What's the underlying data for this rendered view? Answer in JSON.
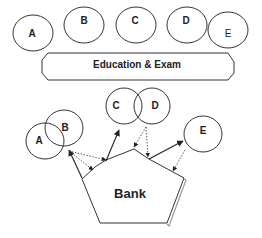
{
  "top_circles": [
    {
      "label": "A"
    },
    {
      "label": "B"
    },
    {
      "label": "C"
    },
    {
      "label": "D"
    },
    {
      "label": "E"
    }
  ],
  "banner": {
    "label": "Education & Exam"
  },
  "bottom": {
    "circles": [
      {
        "label": "A"
      },
      {
        "label": "B"
      },
      {
        "label": "C"
      },
      {
        "label": "D"
      },
      {
        "label": "E"
      }
    ],
    "center": {
      "label": "Bank"
    }
  },
  "colors": {
    "stroke": "#333333",
    "text": "#222222",
    "background": "#ffffff"
  }
}
